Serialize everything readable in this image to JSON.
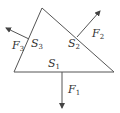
{
  "diagram": {
    "colors": {
      "line": "#555555",
      "text": "#333333",
      "background": "#ffffff"
    },
    "triangle": {
      "vertices": [
        [
          42,
          8
        ],
        [
          14,
          72
        ],
        [
          114,
          72
        ]
      ]
    },
    "sides": [
      {
        "id": "S1",
        "base": "S",
        "sub": "1"
      },
      {
        "id": "S2",
        "base": "S",
        "sub": "2"
      },
      {
        "id": "S3",
        "base": "S",
        "sub": "3"
      }
    ],
    "forces": [
      {
        "id": "F1",
        "base": "F",
        "sub": "1",
        "from": [
          62,
          72
        ],
        "to": [
          62,
          108
        ]
      },
      {
        "id": "F2",
        "base": "F",
        "sub": "2",
        "from": [
          77,
          37
        ],
        "to": [
          100,
          11
        ]
      },
      {
        "id": "F3",
        "base": "F",
        "sub": "3",
        "from": [
          29,
          39
        ],
        "to": [
          6,
          28
        ]
      }
    ]
  }
}
